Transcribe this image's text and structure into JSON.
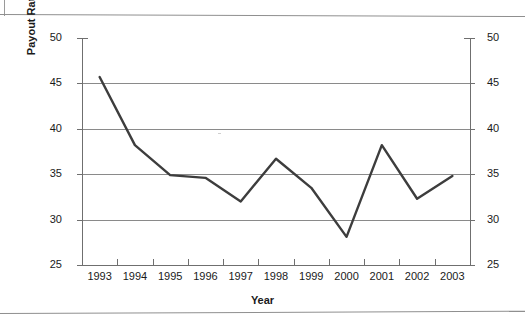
{
  "chart_data": {
    "type": "line",
    "title": "",
    "xlabel": "Year",
    "ylabel": "Payout Rate (Percent)",
    "categories": [
      "1993",
      "1994",
      "1995",
      "1996",
      "1997",
      "1998",
      "1999",
      "2000",
      "2001",
      "2002",
      "2003"
    ],
    "series": [
      {
        "name": "Payout Rate",
        "values": [
          45.7,
          38.2,
          34.9,
          34.6,
          32.0,
          36.7,
          33.5,
          28.1,
          38.2,
          32.3,
          34.8
        ],
        "color": "#3d3d3d"
      }
    ],
    "ylim": [
      25,
      50
    ],
    "yticks": [
      25,
      30,
      35,
      40,
      45,
      50
    ],
    "ytick_labels_left": [
      "25",
      "30",
      "35",
      "40",
      "45",
      "50"
    ],
    "ytick_labels_right": [
      "25",
      "30",
      "35",
      "40",
      "45",
      "50"
    ],
    "grid": true,
    "grid_color": "#8a8a8a",
    "legend": "none",
    "dual_axis": true,
    "axis_color": "#6f6f6f",
    "background": "#ffffff"
  }
}
